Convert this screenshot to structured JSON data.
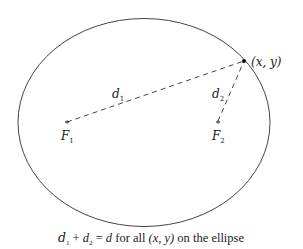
{
  "diagram": {
    "point_label": "(x, y)",
    "focus1": {
      "letter": "F",
      "sub": "1"
    },
    "focus2": {
      "letter": "F",
      "sub": "2"
    },
    "distance1": {
      "letter": "d",
      "sub": "1"
    },
    "distance2": {
      "letter": "d",
      "sub": "2"
    },
    "caption": {
      "d1": "d",
      "s1": "1",
      "plus": " + ",
      "d2": "d",
      "s2": "2",
      "eq": " = ",
      "d": "d",
      "text1": " for all ",
      "point": "(x, y)",
      "text2": " on the ellipse"
    },
    "colors": {
      "stroke": "#333333",
      "text": "#1a1a1a"
    }
  }
}
